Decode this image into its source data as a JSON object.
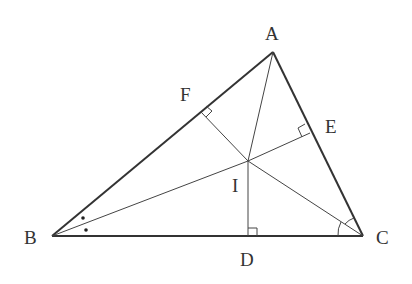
{
  "diagram": {
    "type": "geometry",
    "points": {
      "A": {
        "label": "A",
        "x": 273,
        "y": 52
      },
      "B": {
        "label": "B",
        "x": 52,
        "y": 236
      },
      "C": {
        "label": "C",
        "x": 363,
        "y": 236
      },
      "I": {
        "label": "I",
        "x": 248,
        "y": 161
      },
      "D": {
        "label": "D",
        "x": 248,
        "y": 236
      },
      "E": {
        "label": "E",
        "x": 310,
        "y": 133
      },
      "F": {
        "label": "F",
        "x": 201,
        "y": 112
      }
    },
    "labels": {
      "A": "A",
      "B": "B",
      "C": "C",
      "D": "D",
      "E": "E",
      "F": "F",
      "I": "I"
    },
    "sides": [
      "AB",
      "BC",
      "CA"
    ],
    "segments": [
      "AI",
      "BI",
      "CI",
      "ID",
      "IE",
      "IF"
    ],
    "right_angles": [
      "D",
      "E",
      "F"
    ],
    "angle_marks": {
      "B": "equal dots (bisected)",
      "C": "equal arcs (bisected)"
    },
    "colors": {
      "stroke": "#333333",
      "background": "#ffffff"
    }
  }
}
